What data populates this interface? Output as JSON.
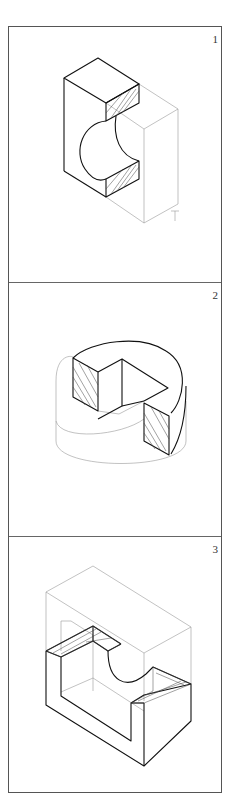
{
  "figures": [
    {
      "number": "1",
      "description": "Isometric section view of rectangular block with cylindrical cut"
    },
    {
      "number": "2",
      "description": "Isometric section view of cylinder with quarter cutaway"
    },
    {
      "number": "3",
      "description": "Isometric section view of U-shaped block with semicircular cut"
    }
  ],
  "colors": {
    "visible_line": "#111111",
    "hidden_line": "#999999",
    "border": "#555555",
    "background": "#ffffff"
  }
}
